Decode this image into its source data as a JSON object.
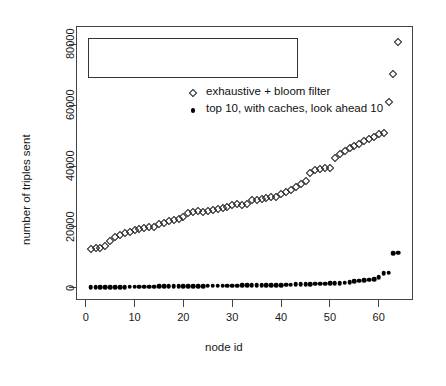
{
  "chart_data": {
    "type": "scatter",
    "title": "",
    "xlabel": "node id",
    "ylabel": "number of triples sent",
    "xlim": [
      -2,
      67
    ],
    "ylim": [
      -4000,
      86000
    ],
    "xticks": [
      0,
      10,
      20,
      30,
      40,
      50,
      60
    ],
    "yticks": [
      0,
      20000,
      40000,
      60000,
      80000
    ],
    "xtick_labels": [
      "0",
      "10",
      "20",
      "30",
      "40",
      "50",
      "60"
    ],
    "ytick_labels": [
      "0",
      "20000",
      "40000",
      "60000",
      "80000"
    ],
    "grid": false,
    "legend_position": "top-left",
    "series": [
      {
        "name": "exhaustive + bloom filter",
        "marker": "open-diamond",
        "color": "#222222",
        "x": [
          1,
          2,
          3,
          4,
          5,
          6,
          7,
          8,
          9,
          10,
          11,
          12,
          13,
          14,
          15,
          16,
          17,
          18,
          19,
          20,
          21,
          22,
          23,
          24,
          25,
          26,
          27,
          28,
          29,
          30,
          31,
          32,
          33,
          34,
          35,
          36,
          37,
          38,
          39,
          40,
          41,
          42,
          43,
          44,
          45,
          46,
          47,
          48,
          49,
          50,
          51,
          52,
          53,
          54,
          55,
          56,
          57,
          58,
          59,
          60,
          61,
          62,
          63,
          64
        ],
        "values": [
          12900,
          12950,
          13100,
          13600,
          15500,
          16800,
          17300,
          17900,
          18400,
          18900,
          19300,
          19600,
          19900,
          20100,
          20800,
          21300,
          21800,
          22300,
          22700,
          23100,
          24600,
          25000,
          25300,
          24900,
          25200,
          25600,
          25900,
          26300,
          26700,
          27100,
          27400,
          27200,
          27600,
          28700,
          28900,
          29100,
          29400,
          29700,
          29900,
          30900,
          31400,
          32000,
          33000,
          34000,
          35000,
          37600,
          38800,
          39100,
          39300,
          39500,
          42700,
          43900,
          45000,
          46000,
          46700,
          47400,
          48300,
          48900,
          49500,
          50400,
          50900,
          61200,
          70200,
          80800
        ]
      },
      {
        "name": "top 10, with caches, look ahead 10",
        "marker": "filled-circle",
        "color": "#000000",
        "x": [
          1,
          2,
          3,
          4,
          5,
          6,
          7,
          8,
          9,
          10,
          11,
          12,
          13,
          14,
          15,
          16,
          17,
          18,
          19,
          20,
          21,
          22,
          23,
          24,
          25,
          26,
          27,
          28,
          29,
          30,
          31,
          32,
          33,
          34,
          35,
          36,
          37,
          38,
          39,
          40,
          41,
          42,
          43,
          44,
          45,
          46,
          47,
          48,
          49,
          50,
          51,
          52,
          53,
          54,
          55,
          56,
          57,
          58,
          59,
          60,
          61,
          62,
          63,
          64
        ],
        "values": [
          150,
          180,
          200,
          220,
          240,
          260,
          280,
          300,
          320,
          340,
          360,
          380,
          400,
          420,
          440,
          460,
          480,
          500,
          520,
          540,
          560,
          580,
          600,
          620,
          640,
          660,
          680,
          700,
          720,
          740,
          760,
          780,
          800,
          820,
          840,
          860,
          880,
          900,
          920,
          940,
          1000,
          1050,
          1100,
          1150,
          1200,
          1250,
          1300,
          1350,
          1400,
          1450,
          1500,
          1600,
          1700,
          1800,
          2200,
          2400,
          2550,
          2700,
          2900,
          3500,
          4800,
          5000,
          11400,
          11500
        ]
      }
    ]
  },
  "legend": {
    "entries": [
      {
        "label": "exhaustive + bloom filter",
        "marker": "open-diamond"
      },
      {
        "label": "top 10, with caches, look ahead 10",
        "marker": "filled-circle"
      }
    ]
  }
}
